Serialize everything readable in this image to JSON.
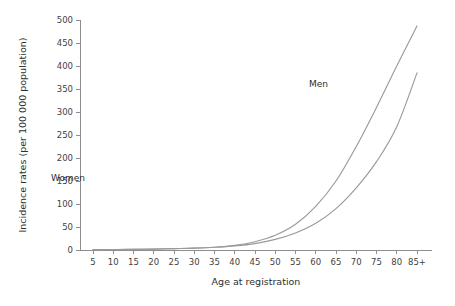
{
  "chart_data": {
    "type": "line",
    "title": "",
    "xlabel": "Age at registration",
    "ylabel": "Incidence rates (per 100 000 population)",
    "categories": [
      "5",
      "10",
      "15",
      "20",
      "25",
      "30",
      "35",
      "40",
      "45",
      "50",
      "55",
      "60",
      "65",
      "70",
      "75",
      "80",
      "85+"
    ],
    "x": [
      5,
      10,
      15,
      20,
      25,
      30,
      35,
      40,
      45,
      50,
      55,
      60,
      65,
      70,
      75,
      80,
      85
    ],
    "ylim": [
      0,
      500
    ],
    "yticks": [
      0,
      50,
      100,
      150,
      200,
      250,
      300,
      350,
      400,
      450,
      500
    ],
    "ytick_labels": [
      "0",
      "50",
      "100",
      "150",
      "200",
      "250",
      "300",
      "350",
      "400",
      "450",
      "500"
    ],
    "grid": false,
    "legend_position": "inline-annotation",
    "series": [
      {
        "name": "Men",
        "color": "#9a9a9a",
        "label_x": 65,
        "label_y": 355,
        "values": [
          1,
          1,
          2,
          2,
          3,
          4,
          6,
          10,
          18,
          32,
          56,
          95,
          150,
          225,
          310,
          400,
          487
        ]
      },
      {
        "name": "Women",
        "color": "#9a9a9a",
        "label_x": 73,
        "label_y": 150,
        "values": [
          1,
          1,
          1,
          2,
          3,
          4,
          6,
          9,
          14,
          23,
          37,
          58,
          90,
          135,
          192,
          268,
          385
        ]
      }
    ],
    "annotations": [
      {
        "text": "Men",
        "x": 65,
        "y": 355
      },
      {
        "text": "Women",
        "x": 73,
        "y": 150
      }
    ]
  }
}
